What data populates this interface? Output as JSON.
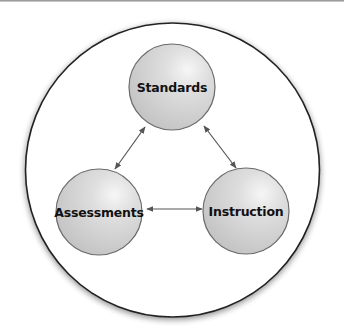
{
  "diagram": {
    "type": "cycle",
    "nodes": [
      {
        "id": "standards",
        "label": "Standards",
        "cx": 172,
        "cy": 87,
        "r": 43
      },
      {
        "id": "assessments",
        "label": "Assessments",
        "cx": 99,
        "cy": 212,
        "r": 43
      },
      {
        "id": "instruction",
        "label": "Instruction",
        "cx": 246,
        "cy": 211,
        "r": 43
      }
    ],
    "edges": [
      {
        "from": "standards",
        "to": "assessments",
        "bidirectional": true
      },
      {
        "from": "standards",
        "to": "instruction",
        "bidirectional": true
      },
      {
        "from": "assessments",
        "to": "instruction",
        "bidirectional": true
      }
    ],
    "colors": {
      "node_fill": "#d4d4d4",
      "node_stroke": "#6a6a6a",
      "arrow": "#555555",
      "outer_stroke": "#222222"
    }
  }
}
